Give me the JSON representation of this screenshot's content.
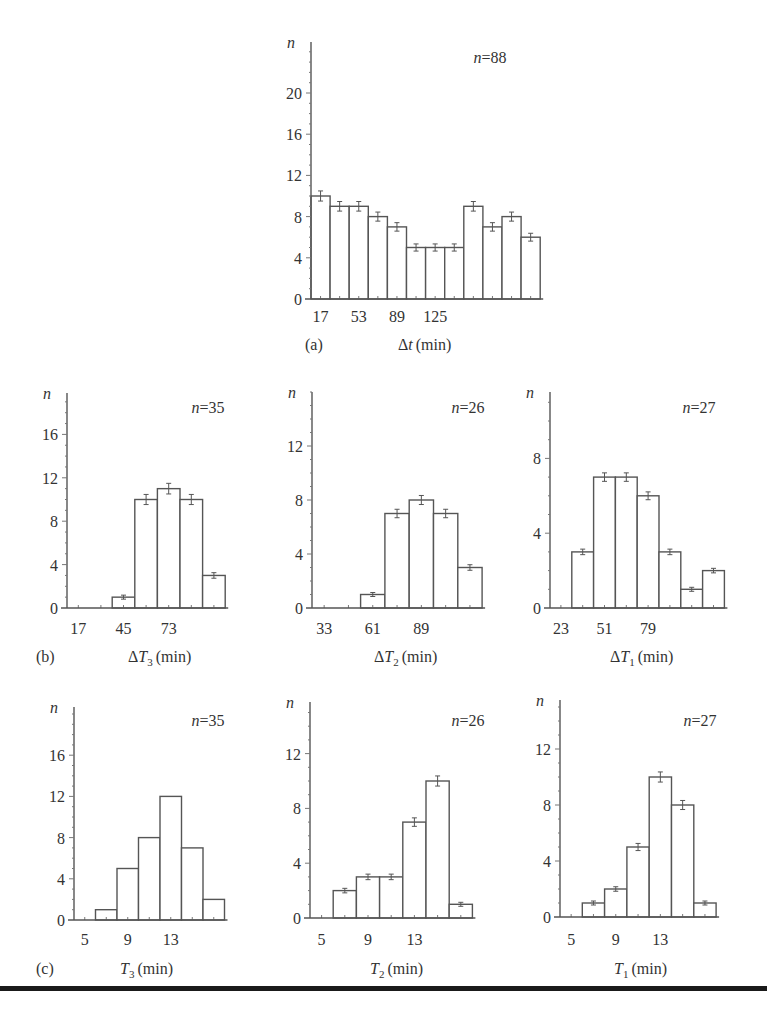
{
  "chart_data": [
    {
      "id": "a",
      "type": "bar",
      "panel_label": "(a)",
      "title": "",
      "annotation": "n = 88",
      "ylabel": "n",
      "xlabel": "Δt (min)",
      "x_tick_labels": [
        "17",
        "53",
        "89",
        "125"
      ],
      "y_ticks": [
        0,
        4,
        8,
        12,
        16,
        20
      ],
      "ylim": [
        0,
        25
      ],
      "bin_starts": [
        17,
        35,
        53,
        71,
        89,
        107,
        125,
        143,
        161,
        179,
        197,
        215
      ],
      "values": [
        10,
        9,
        9,
        8,
        7,
        5,
        5,
        5,
        9,
        7,
        8,
        6
      ],
      "error_bars": true,
      "grid": false
    },
    {
      "id": "b1",
      "type": "bar",
      "panel_label": "(b)",
      "annotation": "n = 35",
      "ylabel": "n",
      "xlabel": "ΔT3 (min)",
      "x_tick_labels": [
        "17",
        "45",
        "73"
      ],
      "y_ticks": [
        0,
        4,
        8,
        12,
        16
      ],
      "ylim": [
        0,
        19
      ],
      "bin_starts": [
        17,
        31,
        45,
        59,
        73,
        87,
        101
      ],
      "values": [
        0,
        0,
        1,
        10,
        11,
        10,
        3
      ],
      "error_bars": true,
      "grid": false
    },
    {
      "id": "b2",
      "type": "bar",
      "panel_label": "",
      "annotation": "n = 26",
      "ylabel": "n",
      "xlabel": "ΔT2 (min)",
      "x_tick_labels": [
        "33",
        "61",
        "89"
      ],
      "y_ticks": [
        0,
        4,
        8,
        12
      ],
      "ylim": [
        0,
        15
      ],
      "bin_starts": [
        33,
        47,
        61,
        75,
        89,
        103,
        117
      ],
      "values": [
        0,
        0,
        1,
        7,
        8,
        7,
        3
      ],
      "error_bars": true,
      "grid": false
    },
    {
      "id": "b3",
      "type": "bar",
      "panel_label": "",
      "annotation": "n = 27",
      "ylabel": "n",
      "xlabel": "ΔT1 (min)",
      "x_tick_labels": [
        "23",
        "51",
        "79"
      ],
      "y_ticks": [
        0,
        4,
        8
      ],
      "ylim": [
        0,
        11.5
      ],
      "bin_starts": [
        23,
        37,
        51,
        65,
        79,
        93,
        107,
        121
      ],
      "values": [
        0,
        3,
        7,
        7,
        6,
        3,
        1,
        2
      ],
      "error_bars": true,
      "grid": false
    },
    {
      "id": "c1",
      "type": "bar",
      "panel_label": "(c)",
      "annotation": "n = 35",
      "ylabel": "n",
      "xlabel": "T3 (min)",
      "x_tick_labels": [
        "5",
        "9",
        "13"
      ],
      "y_ticks": [
        0,
        4,
        8,
        12,
        16
      ],
      "ylim": [
        0,
        19
      ],
      "bin_starts": [
        5,
        7,
        9,
        11,
        13,
        15,
        17
      ],
      "values": [
        0,
        1,
        5,
        8,
        12,
        7,
        2
      ],
      "error_bars": false,
      "grid": false
    },
    {
      "id": "c2",
      "type": "bar",
      "panel_label": "",
      "annotation": "n = 26",
      "ylabel": "n",
      "xlabel": "T2 (min)",
      "x_tick_labels": [
        "5",
        "9",
        "13"
      ],
      "y_ticks": [
        0,
        4,
        8,
        12
      ],
      "ylim": [
        0,
        15
      ],
      "bin_starts": [
        5,
        7,
        9,
        11,
        13,
        15,
        17
      ],
      "values": [
        0,
        2,
        3,
        3,
        7,
        10,
        1
      ],
      "error_bars": true,
      "grid": false
    },
    {
      "id": "c3",
      "type": "bar",
      "panel_label": "",
      "annotation": "n = 27",
      "ylabel": "n",
      "xlabel": "T1 (min)",
      "x_tick_labels": [
        "5",
        "9",
        "13"
      ],
      "y_ticks": [
        0,
        4,
        8,
        12
      ],
      "ylim": [
        0,
        15
      ],
      "bin_starts": [
        5,
        7,
        9,
        11,
        13,
        15,
        17
      ],
      "values": [
        0,
        1,
        2,
        5,
        10,
        8,
        1
      ],
      "error_bars": true,
      "grid": false
    }
  ],
  "layout": [
    {
      "id": "a",
      "axis_x": 311,
      "zero_y": 299,
      "top_y": 42,
      "bar_w": 19.1,
      "px_per_unit": 10.3,
      "tick_bars": [
        0,
        2,
        4,
        6
      ],
      "panel_x": 305,
      "xlabel_x": 398,
      "label_y": 350,
      "tick_y": 322,
      "n_x": 490,
      "n_y": 63,
      "ylabel_x": 288
    },
    {
      "id": "b1",
      "axis_x": 67,
      "zero_y": 608,
      "top_y": 393,
      "bar_w": 22.6,
      "px_per_unit": 10.85,
      "tick_bars": [
        0,
        2,
        4
      ],
      "panel_x": 36,
      "xlabel_x": 128,
      "label_y": 662,
      "tick_y": 634,
      "n_x": 208,
      "n_y": 413,
      "ylabel_x": 44
    },
    {
      "id": "b2",
      "axis_x": 312,
      "zero_y": 608,
      "top_y": 392,
      "bar_w": 24.3,
      "px_per_unit": 13.5,
      "tick_bars": [
        0,
        2,
        4
      ],
      "panel_x": 0,
      "xlabel_x": 374,
      "label_y": 662,
      "tick_y": 634,
      "n_x": 468,
      "n_y": 413,
      "ylabel_x": 290
    },
    {
      "id": "b3",
      "axis_x": 550,
      "zero_y": 608,
      "top_y": 392,
      "bar_w": 21.8,
      "px_per_unit": 18.7,
      "tick_bars": [
        0,
        2,
        4
      ],
      "panel_x": 0,
      "xlabel_x": 610,
      "label_y": 662,
      "tick_y": 634,
      "n_x": 699,
      "n_y": 413,
      "ylabel_x": 527
    },
    {
      "id": "c1",
      "axis_x": 74,
      "zero_y": 920,
      "top_y": 707,
      "bar_w": 21.5,
      "px_per_unit": 10.3,
      "tick_bars": [
        0,
        2,
        4
      ],
      "panel_x": 36,
      "xlabel_x": 120,
      "label_y": 974,
      "tick_y": 945,
      "n_x": 208,
      "n_y": 726,
      "ylabel_x": 44
    },
    {
      "id": "c2",
      "axis_x": 310,
      "zero_y": 918,
      "top_y": 702,
      "bar_w": 23.2,
      "px_per_unit": 13.7,
      "tick_bars": [
        0,
        2,
        4
      ],
      "panel_x": 0,
      "xlabel_x": 370,
      "label_y": 974,
      "tick_y": 945,
      "n_x": 468,
      "n_y": 726,
      "ylabel_x": 290
    },
    {
      "id": "c3",
      "axis_x": 560,
      "zero_y": 917,
      "top_y": 700,
      "bar_w": 22.3,
      "px_per_unit": 14.0,
      "tick_bars": [
        0,
        2,
        4
      ],
      "panel_x": 0,
      "xlabel_x": 614,
      "label_y": 974,
      "tick_y": 945,
      "n_x": 700,
      "n_y": 726,
      "ylabel_x": 535
    }
  ],
  "footer": {
    "rule": true
  }
}
